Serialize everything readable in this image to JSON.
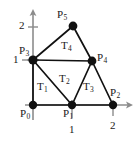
{
  "figure": {
    "kind": "triangulated-polygon-diagram",
    "width": 140,
    "height": 144,
    "background": "#ffffff",
    "edge_color": "#111111",
    "node_color": "#111111",
    "axis_color": "#8c8c8c",
    "text_color": "#1a1a1a"
  },
  "axes": {
    "x_axis": {
      "name": "x-axis",
      "y_px": 105,
      "x_start_px": 25,
      "x_end_px": 133,
      "arrow": "right"
    },
    "y_axis": {
      "name": "y-axis",
      "x_px": 33,
      "y_start_px": 120,
      "y_end_px": 10,
      "arrow": "up"
    },
    "x_ticks": [
      {
        "label": "1",
        "x_px": 72,
        "label_x_px": 69,
        "label_y_px": 124
      },
      {
        "label": "2",
        "x_px": 113,
        "label_x_px": 110,
        "label_y_px": 121
      }
    ],
    "y_ticks": [
      {
        "label": "1",
        "y_px": 60,
        "label_x_px": 13,
        "label_y_px": 55
      },
      {
        "label": "2",
        "y_px": 27,
        "label_x_px": 19,
        "label_y_px": 20
      }
    ]
  },
  "points": [
    {
      "id": "P0",
      "label": "P",
      "sub": "0",
      "cx": 33,
      "cy": 105,
      "label_x": 20,
      "label_y": 108,
      "coord": [
        0,
        0
      ]
    },
    {
      "id": "P1",
      "label": "P",
      "sub": "1",
      "cx": 72,
      "cy": 105,
      "label_x": 63,
      "label_y": 108,
      "coord": [
        1,
        0
      ]
    },
    {
      "id": "P2",
      "label": "P",
      "sub": "2",
      "cx": 113,
      "cy": 105,
      "label_x": 110,
      "label_y": 88,
      "coord": [
        2,
        0
      ]
    },
    {
      "id": "P3",
      "label": "P",
      "sub": "3",
      "cx": 33,
      "cy": 60,
      "label_x": 19,
      "label_y": 45,
      "coord": [
        0,
        1
      ]
    },
    {
      "id": "P4",
      "label": "P",
      "sub": "4",
      "cx": 92,
      "cy": 61,
      "label_x": 97,
      "label_y": 53,
      "coord": [
        1.5,
        1
      ]
    },
    {
      "id": "P5",
      "label": "P",
      "sub": "5",
      "cx": 73,
      "cy": 26,
      "label_x": 57,
      "label_y": 9,
      "coord": [
        1,
        2
      ]
    }
  ],
  "edges": [
    {
      "name": "edge-P0-P1",
      "from": "P0",
      "to": "P1"
    },
    {
      "name": "edge-P1-P2",
      "from": "P1",
      "to": "P2"
    },
    {
      "name": "edge-P0-P3",
      "from": "P0",
      "to": "P3"
    },
    {
      "name": "edge-P3-P1",
      "from": "P3",
      "to": "P1"
    },
    {
      "name": "edge-P3-P4",
      "from": "P3",
      "to": "P4"
    },
    {
      "name": "edge-P1-P4",
      "from": "P1",
      "to": "P4"
    },
    {
      "name": "edge-P4-P2",
      "from": "P4",
      "to": "P2"
    },
    {
      "name": "edge-P3-P5",
      "from": "P3",
      "to": "P5"
    },
    {
      "name": "edge-P5-P4",
      "from": "P5",
      "to": "P4"
    }
  ],
  "triangles": [
    {
      "id": "T1",
      "label": "T",
      "sub": "1",
      "vertices": [
        "P0",
        "P1",
        "P3"
      ],
      "label_x": 37,
      "label_y": 82
    },
    {
      "id": "T2",
      "label": "T",
      "sub": "2",
      "vertices": [
        "P3",
        "P1",
        "P4"
      ],
      "label_x": 59,
      "label_y": 74
    },
    {
      "id": "T3",
      "label": "T",
      "sub": "3",
      "vertices": [
        "P1",
        "P2",
        "P4"
      ],
      "label_x": 83,
      "label_y": 82
    },
    {
      "id": "T4",
      "label": "T",
      "sub": "4",
      "vertices": [
        "P3",
        "P4",
        "P5"
      ],
      "label_x": 61,
      "label_y": 41
    }
  ]
}
